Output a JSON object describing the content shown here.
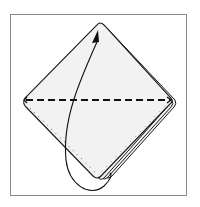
{
  "diagram": {
    "type": "folding-instruction",
    "elements": {
      "frame": "rectangular border",
      "paper": "diamond with stacked layers on lower-right edge",
      "fold_line": "dashed horizontal line between left and right corners",
      "edge_line": "dotted line along lower-left edge",
      "arrow": "curved arrow from bottom corner up to top corner"
    },
    "instruction": "Fold bottom corner up to top corner along the dashed line"
  },
  "colors": {
    "stroke": "#1a1a1a",
    "paper_fill": "#f2f2f2",
    "frame_border": "#8a8a8a",
    "background": "#ffffff"
  }
}
